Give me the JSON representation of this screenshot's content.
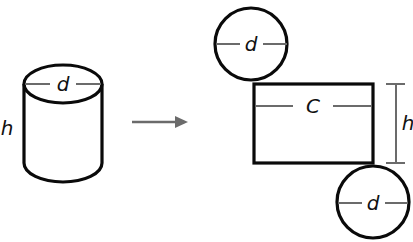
{
  "diagram": {
    "cylinder": {
      "height_label": "h",
      "diameter_label": "d"
    },
    "arrow": {
      "direction": "right"
    },
    "net": {
      "top_circle": {
        "diameter_label": "d"
      },
      "rectangle": {
        "width_label": "C",
        "height_label": "h"
      },
      "bottom_circle": {
        "diameter_label": "d"
      }
    },
    "colors": {
      "outline": "#0a0a0a",
      "guide": "#6b6b6b",
      "background": "#ffffff"
    }
  }
}
